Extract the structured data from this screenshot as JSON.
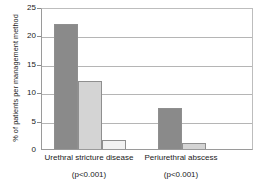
{
  "chart_data": {
    "type": "bar",
    "title": "",
    "subtitle": "",
    "xlabel": "",
    "ylabel": "% of patients per management method",
    "ylim": [
      0,
      25
    ],
    "yticks": [
      0,
      5,
      10,
      15,
      20,
      25
    ],
    "ytick_labels": [
      "0",
      "5",
      "10",
      "15",
      "20",
      "25"
    ],
    "grid": true,
    "legend": "none",
    "categories": [
      "Urethral stricture disease",
      "Periurethral abscess"
    ],
    "category_annotations": [
      "(p<0.001)",
      "(p<0.001)"
    ],
    "series": [
      {
        "name": "series-1",
        "color": "#8a8a8a",
        "values": [
          22.0,
          7.3
        ]
      },
      {
        "name": "series-2",
        "color": "#d4d4d4",
        "values": [
          12.0,
          1.0
        ]
      },
      {
        "name": "series-3",
        "color": "#f2f2f2",
        "values": [
          1.5,
          0.0
        ]
      }
    ]
  },
  "axis": {
    "tick_0": "0",
    "tick_5": "5",
    "tick_10": "10",
    "tick_15": "15",
    "tick_20": "20",
    "tick_25": "25",
    "y_title": "% of patients per management method"
  },
  "groups": {
    "g1_name": "Urethral stricture disease",
    "g1_p": "(p<0.001)",
    "g2_name": "Periurethral abscess",
    "g2_p": "(p<0.001)"
  },
  "colors": {
    "bar_dark": "#8a8a8a",
    "bar_light": "#d4d4d4",
    "bar_pale": "#f2f2f2",
    "bar_border": "#8f8f8f",
    "gridline": "#b5b5b5",
    "axis": "#9a9a9a",
    "text": "#1a1a1a"
  }
}
